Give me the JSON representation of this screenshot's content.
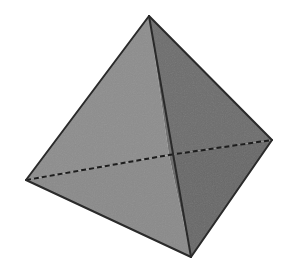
{
  "canvas": {
    "width": 287,
    "height": 270,
    "background_color": "#ffffff"
  },
  "figure": {
    "name": "tetrahedron",
    "edge_color": "#2a2a2a",
    "edge_width": 2,
    "hidden_edge_color": "#1d1d1d",
    "hidden_edge_width": 2,
    "hidden_edge_dash": "5 3",
    "noise_opacity": 0.05
  },
  "vertices": {
    "apex": {
      "label": "apex",
      "x": 149,
      "y": 16
    },
    "left": {
      "label": "left",
      "x": 26,
      "y": 180
    },
    "right": {
      "label": "right",
      "x": 272,
      "y": 140
    },
    "bottom": {
      "label": "bottom",
      "x": 191,
      "y": 257
    },
    "back": {
      "label": "back-hidden",
      "x": 169,
      "y": 155
    }
  },
  "faces": [
    {
      "name": "upper-left-face",
      "vertices": [
        "apex",
        "left",
        "back"
      ],
      "fill": "#8d8d8d"
    },
    {
      "name": "lower-left-face",
      "vertices": [
        "left",
        "bottom",
        "back"
      ],
      "fill": "#8a8a8a"
    },
    {
      "name": "upper-right-face",
      "vertices": [
        "apex",
        "back",
        "right"
      ],
      "fill": "#6d6d6d"
    },
    {
      "name": "lower-right-face",
      "vertices": [
        "back",
        "bottom",
        "right"
      ],
      "fill": "#686868"
    }
  ],
  "visible_edges": [
    {
      "name": "edge-apex-left",
      "from": "apex",
      "to": "left"
    },
    {
      "name": "edge-apex-right",
      "from": "apex",
      "to": "right"
    },
    {
      "name": "edge-apex-bottom",
      "from": "apex",
      "to": "bottom"
    },
    {
      "name": "edge-left-bottom",
      "from": "left",
      "to": "bottom"
    },
    {
      "name": "edge-right-bottom",
      "from": "right",
      "to": "bottom"
    }
  ],
  "hidden_edges": [
    {
      "name": "hidden-edge-left-back",
      "from": "left",
      "to": "back"
    },
    {
      "name": "hidden-edge-back-right",
      "from": "back",
      "to": "right"
    }
  ]
}
